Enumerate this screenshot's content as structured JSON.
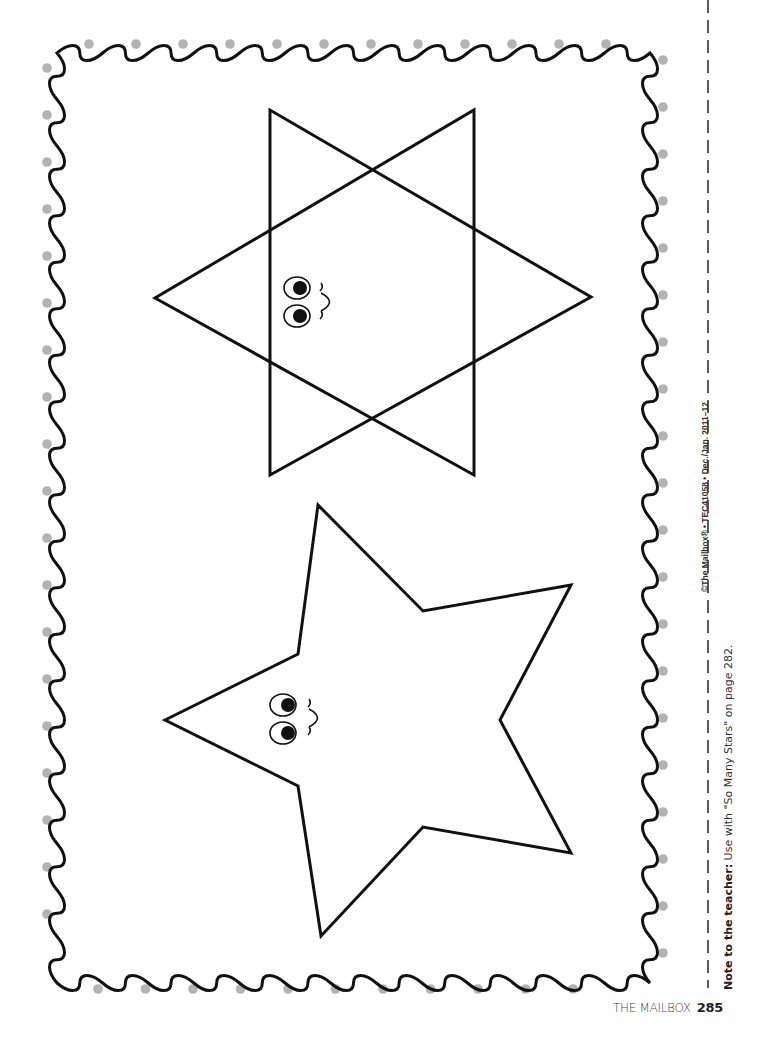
{
  "page": {
    "credit_line": "©The Mailbox® • TEC41058 • Dec./Jan. 2011–12",
    "note": {
      "label": "Note to the teacher:",
      "text": " Use with \"So Many Stars\" on page 282."
    },
    "footer": {
      "publication": "THE MAILBOX",
      "page_number": "285"
    }
  },
  "artwork": {
    "shapes": [
      {
        "name": "six-pointed-star",
        "face": "smiley"
      },
      {
        "name": "five-pointed-star",
        "face": "smiley"
      }
    ],
    "border": {
      "style": "wavy-line-with-dots",
      "dot_color": "#b3b3b3",
      "line_color": "#111111"
    },
    "cut_line": {
      "style": "dashed",
      "color": "#333333"
    }
  }
}
